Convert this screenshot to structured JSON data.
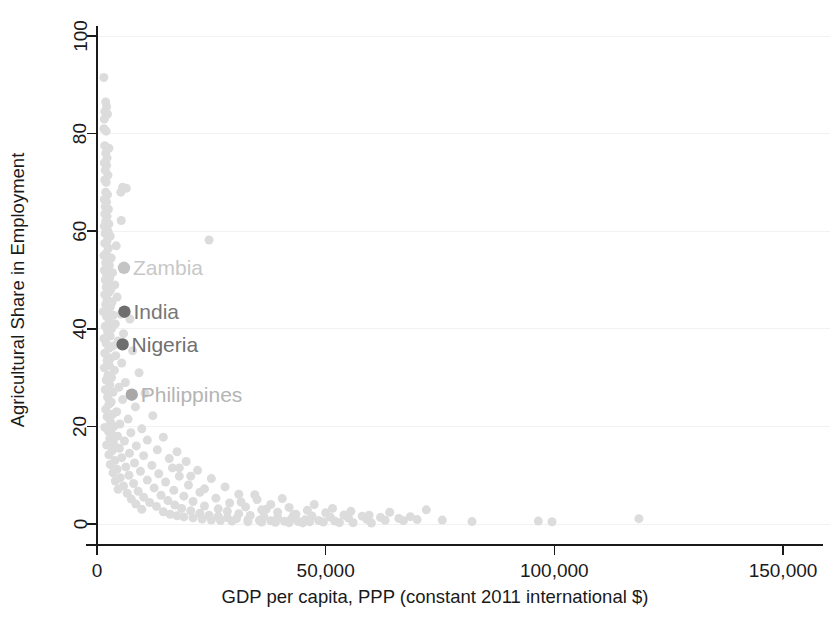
{
  "chart_data": {
    "type": "scatter",
    "title": "",
    "xlabel": "GDP per capita, PPP (constant 2011 international $)",
    "ylabel": "Agricultural Share in Employment",
    "xlim": [
      0,
      150000
    ],
    "ylim": [
      0,
      100
    ],
    "xticks": [
      0,
      50000,
      100000,
      150000
    ],
    "xticklabels": [
      "0",
      "50,000",
      "100,000",
      "150,000"
    ],
    "yticks": [
      0,
      20,
      40,
      60,
      80,
      100
    ],
    "yticklabels": [
      "0",
      "20",
      "40",
      "60",
      "80",
      "100"
    ],
    "grid": "horizontal-faint",
    "legend": "none",
    "marker_color": "#dcdcdc",
    "marker_size": 9,
    "annotations": [
      {
        "label": "Zambia",
        "x": 5900,
        "y": 52.5,
        "marker_color": "#c4c4c4",
        "text_color": "#c8c8c8"
      },
      {
        "label": "India",
        "x": 6000,
        "y": 43.5,
        "marker_color": "#6e6e6e",
        "text_color": "#777777"
      },
      {
        "label": "Nigeria",
        "x": 5600,
        "y": 36.8,
        "marker_color": "#6e6e6e",
        "text_color": "#707070"
      },
      {
        "label": "Philippines",
        "x": 7600,
        "y": 26.5,
        "marker_color": "#a8a8a8",
        "text_color": "#b4b4b4"
      }
    ],
    "points": [
      [
        1500,
        91.5
      ],
      [
        1900,
        86.5
      ],
      [
        2100,
        85.5
      ],
      [
        1700,
        84.5
      ],
      [
        2300,
        84.0
      ],
      [
        1600,
        83.0
      ],
      [
        1500,
        81.0
      ],
      [
        2000,
        80.5
      ],
      [
        1700,
        77.5
      ],
      [
        2600,
        77.0
      ],
      [
        1900,
        76.0
      ],
      [
        2200,
        75.0
      ],
      [
        1600,
        74.0
      ],
      [
        2100,
        73.5
      ],
      [
        1800,
        72.5
      ],
      [
        2400,
        71.5
      ],
      [
        1700,
        70.5
      ],
      [
        2000,
        70.0
      ],
      [
        5600,
        69.0
      ],
      [
        6400,
        68.8
      ],
      [
        5200,
        68.0
      ],
      [
        1900,
        68.0
      ],
      [
        2300,
        67.5
      ],
      [
        1600,
        66.5
      ],
      [
        2100,
        66.0
      ],
      [
        1800,
        65.0
      ],
      [
        2500,
        64.5
      ],
      [
        1700,
        63.5
      ],
      [
        2200,
        63.0
      ],
      [
        5300,
        62.2
      ],
      [
        1900,
        62.0
      ],
      [
        2600,
        61.5
      ],
      [
        1600,
        61.0
      ],
      [
        2000,
        60.5
      ],
      [
        2400,
        60.0
      ],
      [
        1800,
        59.5
      ],
      [
        2900,
        59.0
      ],
      [
        24500,
        58.2
      ],
      [
        2200,
        58.0
      ],
      [
        1700,
        57.5
      ],
      [
        4200,
        57.0
      ],
      [
        2500,
        56.5
      ],
      [
        2000,
        55.5
      ],
      [
        1500,
        55.0
      ],
      [
        3100,
        54.5
      ],
      [
        2300,
        54.0
      ],
      [
        1900,
        53.5
      ],
      [
        2700,
        53.0
      ],
      [
        1600,
        52.0
      ],
      [
        3400,
        51.5
      ],
      [
        2100,
        51.0
      ],
      [
        2800,
        50.5
      ],
      [
        1800,
        50.0
      ],
      [
        2400,
        49.5
      ],
      [
        3900,
        49.0
      ],
      [
        2000,
        48.5
      ],
      [
        3000,
        48.0
      ],
      [
        2600,
        47.5
      ],
      [
        1700,
        47.0
      ],
      [
        4400,
        46.5
      ],
      [
        2200,
        46.0
      ],
      [
        3300,
        45.5
      ],
      [
        1900,
        45.0
      ],
      [
        2900,
        44.5
      ],
      [
        2500,
        44.0
      ],
      [
        1400,
        43.5
      ],
      [
        5200,
        43.0
      ],
      [
        3600,
        42.8
      ],
      [
        2100,
        42.5
      ],
      [
        7200,
        42.0
      ],
      [
        2700,
        41.5
      ],
      [
        4000,
        41.0
      ],
      [
        1800,
        40.5
      ],
      [
        3200,
        40.0
      ],
      [
        2300,
        39.5
      ],
      [
        5800,
        39.0
      ],
      [
        2900,
        38.5
      ],
      [
        1500,
        38.0
      ],
      [
        4600,
        37.5
      ],
      [
        2000,
        37.0
      ],
      [
        3500,
        36.5
      ],
      [
        2600,
        36.0
      ],
      [
        7800,
        35.5
      ],
      [
        1700,
        35.0
      ],
      [
        4100,
        34.5
      ],
      [
        3000,
        34.0
      ],
      [
        2200,
        33.5
      ],
      [
        5400,
        33.0
      ],
      [
        2700,
        32.5
      ],
      [
        1600,
        32.0
      ],
      [
        3800,
        31.5
      ],
      [
        9200,
        31.0
      ],
      [
        2400,
        30.5
      ],
      [
        3200,
        30.0
      ],
      [
        2000,
        29.5
      ],
      [
        6200,
        29.0
      ],
      [
        2800,
        28.5
      ],
      [
        4800,
        28.0
      ],
      [
        1800,
        27.5
      ],
      [
        3500,
        27.0
      ],
      [
        10500,
        26.8
      ],
      [
        2300,
        26.0
      ],
      [
        5600,
        25.5
      ],
      [
        3100,
        25.0
      ],
      [
        2600,
        24.5
      ],
      [
        8400,
        24.0
      ],
      [
        1900,
        23.5
      ],
      [
        4300,
        23.0
      ],
      [
        3400,
        22.5
      ],
      [
        12200,
        22.2
      ],
      [
        2200,
        22.0
      ],
      [
        6800,
        21.5
      ],
      [
        2900,
        21.0
      ],
      [
        5000,
        20.5
      ],
      [
        3700,
        20.0
      ],
      [
        1700,
        19.8
      ],
      [
        9800,
        19.5
      ],
      [
        2500,
        19.0
      ],
      [
        7400,
        18.7
      ],
      [
        3200,
        18.5
      ],
      [
        4500,
        18.0
      ],
      [
        14500,
        17.8
      ],
      [
        2800,
        17.5
      ],
      [
        11000,
        17.2
      ],
      [
        6000,
        17.0
      ],
      [
        3600,
        16.5
      ],
      [
        2100,
        16.2
      ],
      [
        8600,
        16.0
      ],
      [
        4900,
        15.5
      ],
      [
        13200,
        15.2
      ],
      [
        3300,
        15.0
      ],
      [
        17500,
        14.8
      ],
      [
        7100,
        14.5
      ],
      [
        2600,
        14.2
      ],
      [
        10200,
        14.0
      ],
      [
        5400,
        13.6
      ],
      [
        15800,
        13.4
      ],
      [
        3900,
        13.0
      ],
      [
        19500,
        12.8
      ],
      [
        8200,
        12.5
      ],
      [
        2900,
        12.2
      ],
      [
        12000,
        12.0
      ],
      [
        6300,
        11.7
      ],
      [
        16500,
        11.5
      ],
      [
        4400,
        11.2
      ],
      [
        22000,
        11.0
      ],
      [
        9500,
        10.8
      ],
      [
        3500,
        10.5
      ],
      [
        13500,
        10.3
      ],
      [
        7000,
        10.0
      ],
      [
        18000,
        9.8
      ],
      [
        5100,
        9.5
      ],
      [
        25000,
        9.3
      ],
      [
        11000,
        9.0
      ],
      [
        4000,
        8.8
      ],
      [
        15000,
        8.6
      ],
      [
        8000,
        8.3
      ],
      [
        20000,
        8.0
      ],
      [
        5800,
        7.8
      ],
      [
        28000,
        7.6
      ],
      [
        12500,
        7.4
      ],
      [
        4600,
        7.1
      ],
      [
        16800,
        6.9
      ],
      [
        9000,
        6.7
      ],
      [
        22500,
        6.5
      ],
      [
        6600,
        6.3
      ],
      [
        31000,
        6.1
      ],
      [
        14000,
        5.9
      ],
      [
        19000,
        5.7
      ],
      [
        10200,
        5.5
      ],
      [
        26000,
        5.3
      ],
      [
        7500,
        5.1
      ],
      [
        35000,
        5.0
      ],
      [
        15500,
        4.8
      ],
      [
        21000,
        4.6
      ],
      [
        11500,
        4.4
      ],
      [
        29000,
        4.3
      ],
      [
        8500,
        4.1
      ],
      [
        38000,
        4.0
      ],
      [
        17000,
        3.9
      ],
      [
        23500,
        3.7
      ],
      [
        13000,
        3.6
      ],
      [
        32500,
        3.5
      ],
      [
        42000,
        3.4
      ],
      [
        18500,
        3.2
      ],
      [
        26500,
        3.1
      ],
      [
        9800,
        3.0
      ],
      [
        36000,
        2.9
      ],
      [
        46000,
        2.8
      ],
      [
        20500,
        2.7
      ],
      [
        28500,
        2.6
      ],
      [
        14500,
        2.5
      ],
      [
        39500,
        2.4
      ],
      [
        50000,
        2.3
      ],
      [
        22500,
        2.2
      ],
      [
        31000,
        2.1
      ],
      [
        16000,
        2.0
      ],
      [
        43000,
        1.9
      ],
      [
        54000,
        1.85
      ],
      [
        24500,
        1.8
      ],
      [
        33500,
        1.75
      ],
      [
        17500,
        1.7
      ],
      [
        47000,
        1.65
      ],
      [
        58000,
        1.6
      ],
      [
        26500,
        1.55
      ],
      [
        36500,
        1.5
      ],
      [
        19000,
        1.45
      ],
      [
        51000,
        1.4
      ],
      [
        62000,
        1.35
      ],
      [
        28500,
        1.3
      ],
      [
        39500,
        1.28
      ],
      [
        21000,
        1.25
      ],
      [
        55000,
        1.2
      ],
      [
        66000,
        1.15
      ],
      [
        30500,
        1.1
      ],
      [
        42500,
        1.05
      ],
      [
        23000,
        1.0
      ],
      [
        59000,
        0.95
      ],
      [
        70000,
        0.9
      ],
      [
        33000,
        0.88
      ],
      [
        45500,
        0.85
      ],
      [
        25000,
        0.8
      ],
      [
        63000,
        0.78
      ],
      [
        35500,
        0.75
      ],
      [
        48500,
        0.72
      ],
      [
        27000,
        0.7
      ],
      [
        67000,
        0.68
      ],
      [
        38000,
        0.65
      ],
      [
        52000,
        0.6
      ],
      [
        29500,
        0.58
      ],
      [
        41000,
        0.55
      ],
      [
        44000,
        0.5
      ],
      [
        33000,
        0.48
      ],
      [
        46500,
        0.45
      ],
      [
        36000,
        0.42
      ],
      [
        49500,
        0.4
      ],
      [
        39000,
        0.35
      ],
      [
        53000,
        0.3
      ],
      [
        42000,
        0.28
      ],
      [
        56000,
        0.25
      ],
      [
        45000,
        0.22
      ],
      [
        60000,
        0.2
      ],
      [
        31500,
        4.5
      ],
      [
        34500,
        6.0
      ],
      [
        37000,
        3.0
      ],
      [
        40500,
        5.2
      ],
      [
        43500,
        2.0
      ],
      [
        47500,
        4.0
      ],
      [
        51500,
        3.2
      ],
      [
        55500,
        2.6
      ],
      [
        59500,
        1.8
      ],
      [
        64000,
        2.4
      ],
      [
        68500,
        1.5
      ],
      [
        72000,
        2.9
      ],
      [
        75500,
        0.8
      ],
      [
        82000,
        0.5
      ],
      [
        96500,
        0.6
      ],
      [
        99500,
        0.45
      ],
      [
        118500,
        1.1
      ],
      [
        20500,
        9.8
      ],
      [
        23500,
        7.2
      ],
      [
        18000,
        11.5
      ]
    ]
  }
}
